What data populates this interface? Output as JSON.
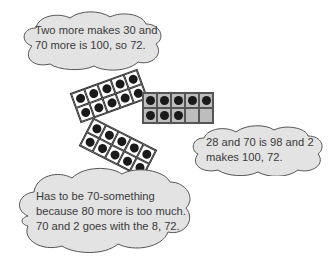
{
  "clouds": [
    {
      "id": "top",
      "lines": [
        "Two more makes 30 and",
        "70 more is 100, so 72."
      ]
    },
    {
      "id": "right",
      "lines": [
        "28 and 70 is 98 and 2",
        "makes 100, 72."
      ]
    },
    {
      "id": "bottom",
      "lines": [
        "Has to be 70-something",
        "because 80 more is too much.",
        "70 and 2 goes with the 8, 72."
      ]
    }
  ],
  "ten_frames": [
    {
      "id": "tilted-upper",
      "filled": 10,
      "shaded": false
    },
    {
      "id": "grey",
      "filled": 8,
      "shaded": true
    },
    {
      "id": "tilted-lower",
      "filled": 10,
      "shaded": false
    }
  ],
  "colors": {
    "cloud_fill": "#e3e3e3",
    "cloud_stroke": "#555555",
    "frame_grey": "#bdbdbd",
    "dot": "#1a1a1a"
  }
}
